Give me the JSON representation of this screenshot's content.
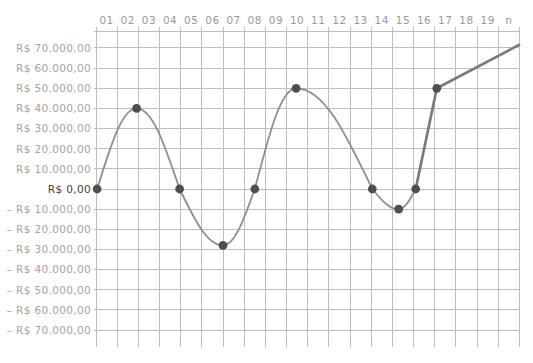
{
  "chart_data": {
    "type": "line",
    "title": "",
    "legend_position": "none",
    "grid": true,
    "x_axis_labels": [
      "01",
      "02",
      "03",
      "04",
      "05",
      "06",
      "07",
      "08",
      "09",
      "10",
      "11",
      "12",
      "13",
      "14",
      "15",
      "16",
      "17",
      "18",
      "19",
      "n"
    ],
    "y_axis_labels": [
      {
        "text": "R$ 70.000,00",
        "value": 70000,
        "emphasis": false
      },
      {
        "text": "R$ 60.000,00",
        "value": 60000,
        "emphasis": false
      },
      {
        "text": "R$ 50.000,00",
        "value": 50000,
        "emphasis": false
      },
      {
        "text": "R$ 40.000,00",
        "value": 40000,
        "emphasis": false
      },
      {
        "text": "R$ 30.000,00",
        "value": 30000,
        "emphasis": false
      },
      {
        "text": "R$ 20.000,00",
        "value": 20000,
        "emphasis": false
      },
      {
        "text": "R$ 10.000,00",
        "value": 10000,
        "emphasis": false
      },
      {
        "text": "R$ 0,00",
        "value": 0,
        "emphasis": true
      },
      {
        "text": "– R$ 10.000,00",
        "value": -10000,
        "emphasis": false
      },
      {
        "text": "– R$ 20.000,00",
        "value": -20000,
        "emphasis": false
      },
      {
        "text": "– R$ 30.000,00",
        "value": -30000,
        "emphasis": false
      },
      {
        "text": "– R$ 40.000,00",
        "value": -40000,
        "emphasis": false
      },
      {
        "text": "– R$ 50.000,00",
        "value": -50000,
        "emphasis": false
      },
      {
        "text": "– R$ 60.000,00",
        "value": -60000,
        "emphasis": false
      },
      {
        "text": "– R$ 70.000,00",
        "value": -70000,
        "emphasis": false
      }
    ],
    "xlim": [
      0,
      20
    ],
    "ylim": [
      -78000,
      80000
    ],
    "currency_unit": "R$",
    "series": [
      {
        "name": "accumulated-cash-flow",
        "points": [
          {
            "x": 0.05,
            "value": 0,
            "role": "zero",
            "dot": true,
            "join": "start"
          },
          {
            "x": 1.92,
            "value": 40000,
            "role": "extremum",
            "dot": true,
            "join": "wave"
          },
          {
            "x": 3.95,
            "value": 0,
            "role": "zero",
            "dot": true,
            "join": "wave"
          },
          {
            "x": 6.0,
            "value": -28000,
            "role": "extremum",
            "dot": true,
            "join": "wave"
          },
          {
            "x": 7.5,
            "value": 0,
            "role": "zero",
            "dot": true,
            "join": "wave"
          },
          {
            "x": 9.45,
            "value": 50000,
            "role": "extremum",
            "dot": true,
            "join": "wave"
          },
          {
            "x": 13.05,
            "value": 0,
            "role": "zero",
            "dot": true,
            "join": "wave"
          },
          {
            "x": 14.3,
            "value": -10000,
            "role": "extremum",
            "dot": true,
            "join": "wave"
          },
          {
            "x": 15.1,
            "value": 0,
            "role": "zero",
            "dot": true,
            "join": "wave"
          },
          {
            "x": 16.1,
            "value": 50000,
            "role": "extremum",
            "dot": true,
            "join": "steep"
          },
          {
            "x": 19.98,
            "value": 71500,
            "role": "end",
            "dot": false,
            "join": "line"
          }
        ]
      }
    ],
    "colors": {
      "background": "#ffffff",
      "grid": "#bdbdbd",
      "curve": "#8f8f8f",
      "accent_line": "#7a7a7a",
      "dot": "#4e4e4e",
      "y_label": "#a3a3a3",
      "y_label_zero": "#3d3d3d",
      "x_label": "#999999"
    }
  }
}
